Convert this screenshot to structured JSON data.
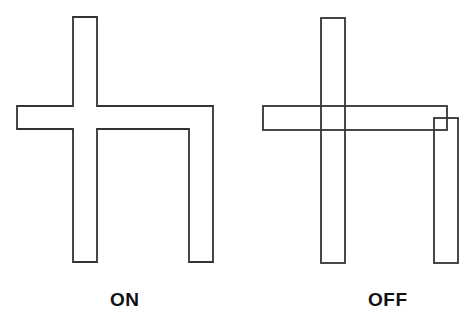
{
  "diagram": {
    "type": "comparison",
    "stroke_color": "#333333",
    "background": "#ffffff",
    "panels": [
      {
        "label": "ON",
        "description": "Merged outline: vertical bar, horizontal bar and right vertical leg joined into a single continuous shape",
        "polygon": [
          [
            73,
            17
          ],
          [
            97,
            17
          ],
          [
            97,
            106
          ],
          [
            213,
            106
          ],
          [
            213,
            262
          ],
          [
            189,
            262
          ],
          [
            189,
            129
          ],
          [
            97,
            129
          ],
          [
            97,
            262
          ],
          [
            73,
            262
          ],
          [
            73,
            129
          ],
          [
            17,
            129
          ],
          [
            17,
            106
          ],
          [
            73,
            106
          ]
        ]
      },
      {
        "label": "OFF",
        "description": "Three separate overlapping rectangles drawn independently",
        "rects": [
          {
            "name": "vertical-bar",
            "x": 321,
            "y": 18,
            "w": 24,
            "h": 245
          },
          {
            "name": "horizontal-bar",
            "x": 263,
            "y": 106,
            "w": 184,
            "h": 24
          },
          {
            "name": "right-leg",
            "x": 434,
            "y": 118,
            "w": 24,
            "h": 145
          }
        ]
      }
    ]
  },
  "labels": {
    "on": "ON",
    "off": "OFF"
  }
}
